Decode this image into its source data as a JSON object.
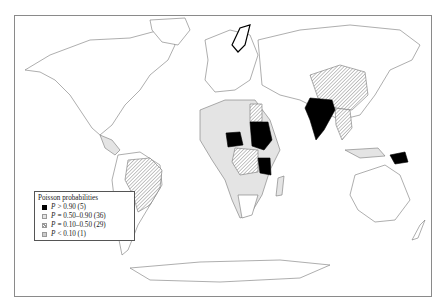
{
  "figure": {
    "type": "world choropleth map",
    "legend": {
      "title": "Poisson probabilities",
      "items": [
        {
          "symbol": "P",
          "label": "> 0.90 (5)",
          "style": "black",
          "color": "#000000"
        },
        {
          "symbol": "P",
          "label": "= 0.50–0.90 (36)",
          "style": "light-grey",
          "color": "#e4e4e4"
        },
        {
          "symbol": "P",
          "label": "= 0.10–0.50 (29)",
          "style": "hatched",
          "color": "#999999"
        },
        {
          "symbol": "P",
          "label": "< 0.10 (1)",
          "style": "stippled",
          "color": "#cccccc"
        }
      ]
    },
    "highlighted_black": [
      "India",
      "Sudan",
      "Central African Republic",
      "Tanzania",
      "Papua New Guinea"
    ],
    "hatched_regions": [
      "China",
      "Brazil",
      "Egypt",
      "Democratic Republic of the Congo",
      "Mozambique",
      "Zambia",
      "Myanmar",
      "Southeast Asia",
      "Botswana"
    ],
    "light_grey_regions": [
      "West Africa",
      "Ethiopia",
      "Kenya",
      "Madagascar",
      "Indonesia",
      "Central America"
    ]
  }
}
